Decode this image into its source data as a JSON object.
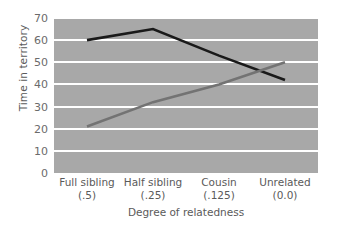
{
  "chart_data": {
    "type": "line",
    "title": "",
    "xlabel": "Degree of relatedness",
    "ylabel": "Time in territory",
    "categories": [
      "Full sibling",
      "Half sibling",
      "Cousin",
      "Unrelated"
    ],
    "category_sublabels": [
      "(.5)",
      "(.25)",
      "(.125)",
      "(0.0)"
    ],
    "ylim": [
      0,
      70
    ],
    "yticks": [
      0,
      10,
      20,
      30,
      40,
      50,
      60,
      70
    ],
    "ytick_labels": [
      "0",
      "10",
      "20",
      "30",
      "40",
      "50",
      "60",
      "70"
    ],
    "grid": true,
    "grid_color": "#ffffff",
    "plot_background": "#a8a8a8",
    "legend": "none",
    "series": [
      {
        "name": "dark-line",
        "color": "#1a1a1a",
        "values": [
          60,
          65,
          53,
          42
        ]
      },
      {
        "name": "gray-line",
        "color": "#737373",
        "values": [
          21,
          32,
          40,
          50
        ]
      }
    ]
  }
}
